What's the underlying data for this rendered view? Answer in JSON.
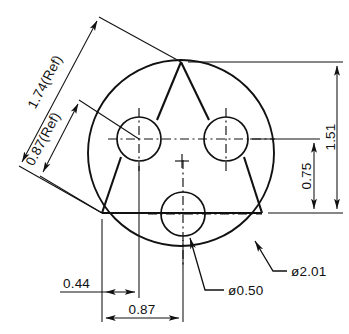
{
  "drawing": {
    "title": "Three-hole circular flange detail",
    "type": "engineering-drawing",
    "units": "inches",
    "line_color": "#111111",
    "background_color": "#ffffff",
    "dimensions": {
      "outer_diameter": "ø2.01",
      "hole_diameter": "ø0.50",
      "vertical_upper": "1.51",
      "vertical_lower": "0.75",
      "horizontal_small": "0.44",
      "horizontal_large": "0.87",
      "diagonal_long": "1.74(Ref)",
      "diagonal_short": "0.87(Ref)"
    },
    "callouts": [
      {
        "label": "ø0.50",
        "target": "bolt-hole"
      },
      {
        "label": "ø2.01",
        "target": "outer-circle"
      }
    ],
    "geometry": {
      "outer_circle": {
        "cx": 181,
        "cy": 153,
        "r": 93
      },
      "holes": [
        {
          "name": "upper-left-hole",
          "cx": 139,
          "cy": 139,
          "r": 22
        },
        {
          "name": "upper-right-hole",
          "cx": 226,
          "cy": 139,
          "r": 22
        },
        {
          "name": "bottom-hole",
          "cx": 183,
          "cy": 214,
          "r": 22
        }
      ],
      "triangle_vertices": [
        {
          "x": 181,
          "y": 62
        },
        {
          "x": 102,
          "y": 213
        },
        {
          "x": 262,
          "y": 213
        }
      ]
    }
  }
}
